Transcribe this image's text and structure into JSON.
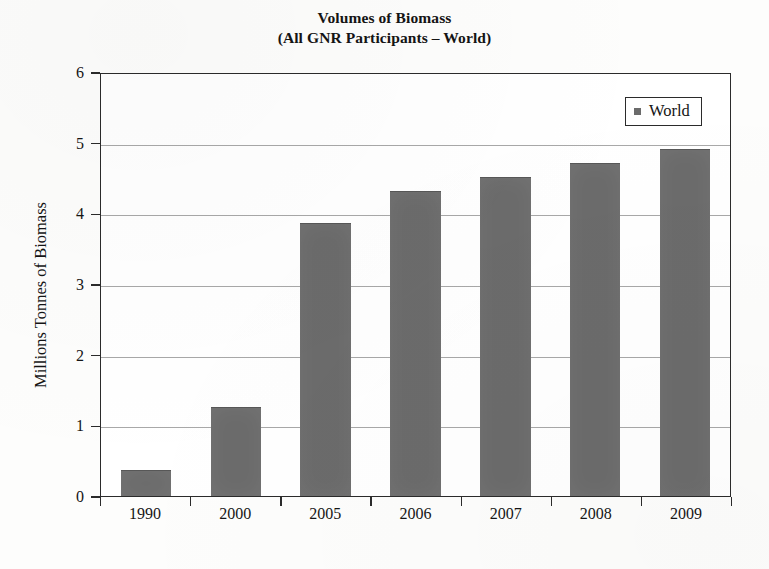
{
  "chart_data": {
    "type": "bar",
    "title": "Volumes of Biomass",
    "subtitle": "(All GNR Participants – World)",
    "categories": [
      "1990",
      "2000",
      "2005",
      "2006",
      "2007",
      "2008",
      "2009"
    ],
    "values": [
      0.35,
      1.25,
      3.85,
      4.3,
      4.5,
      4.7,
      4.9
    ],
    "series": [
      {
        "name": "World",
        "values": [
          0.35,
          1.25,
          3.85,
          4.3,
          4.5,
          4.7,
          4.9
        ]
      }
    ],
    "xlabel": "",
    "ylabel": "Millions Tonnes of Biomass",
    "ylim": [
      0,
      6
    ],
    "ytick_labels": [
      "0",
      "1",
      "2",
      "3",
      "4",
      "5",
      "6"
    ],
    "ytick_values": [
      0,
      1,
      2,
      3,
      4,
      5,
      6
    ],
    "grid": true,
    "legend": {
      "position": "top-right",
      "entries": [
        "World"
      ],
      "swatch_color": "#6b6b6b"
    },
    "bar_color": "#6b6b6b",
    "axis_color": "#2b2b2b",
    "gridline_color": "#a8a8a8",
    "background_color": "#ffffff"
  }
}
